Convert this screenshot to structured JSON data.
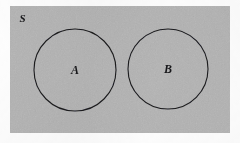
{
  "figure": {
    "kind": "set-diagram",
    "canvas": {
      "width": 240,
      "height": 143,
      "page_background": "#fdfdfd"
    },
    "universe": {
      "name": "universal-set",
      "label": "S",
      "rect": {
        "x": 10,
        "y": 6,
        "width": 220,
        "height": 127
      },
      "fill": "#b4b4b4",
      "stroke": "none",
      "label_position": {
        "x": 19.5,
        "y": 21.5
      }
    },
    "sets": [
      {
        "name": "set-a",
        "label": "A",
        "center": {
          "x": 75,
          "y": 70
        },
        "radius": 41,
        "stroke": "#1b1b1e",
        "stroke_width": 1.1,
        "fill": "none",
        "label_position": {
          "x": 75,
          "y": 74
        }
      },
      {
        "name": "set-b",
        "label": "B",
        "center": {
          "x": 168,
          "y": 69
        },
        "radius": 40,
        "stroke": "#1b1b1e",
        "stroke_width": 1.1,
        "fill": "none",
        "label_position": {
          "x": 168,
          "y": 73
        }
      }
    ],
    "relationship": "disjoint"
  },
  "chart_data": {
    "type": "diagram",
    "title": "",
    "subtype": "venn-two-set-disjoint",
    "universe_label": "S",
    "set_labels": [
      "A",
      "B"
    ],
    "intersection": "empty",
    "colors": {
      "background": "#b4b4b4",
      "outline": "#1b1b1e",
      "text": "#17171a"
    }
  }
}
